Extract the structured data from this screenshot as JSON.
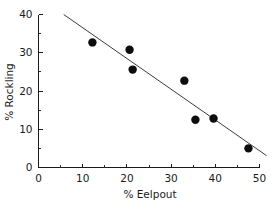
{
  "chart_data": {
    "type": "scatter",
    "title": "",
    "xlabel": "% Eelpout",
    "ylabel": "% Rockling",
    "xlim": [
      0,
      50
    ],
    "ylim": [
      0,
      40
    ],
    "xticks": [
      0,
      10,
      20,
      30,
      40,
      50
    ],
    "yticks": [
      0,
      10,
      20,
      30,
      40
    ],
    "xtick_labels": [
      "0",
      "10",
      "20",
      "30",
      "40",
      "50"
    ],
    "ytick_labels": [
      "0",
      "10",
      "20",
      "30",
      "40"
    ],
    "x_minor_ticks": [
      5,
      15,
      25,
      35,
      45
    ],
    "y_minor_ticks": [
      5,
      15,
      25,
      35
    ],
    "grid": false,
    "legend": false,
    "marker_style": "filled-circle",
    "marker_color": "#0d0d0d",
    "marker_size_px": 4.2,
    "line_color": "#3c3c3c",
    "background_color": "#ffffff",
    "axis_color": "#1a1a1a",
    "points": [
      {
        "x": 12.2,
        "y": 32.7
      },
      {
        "x": 20.6,
        "y": 30.8
      },
      {
        "x": 21.3,
        "y": 25.6
      },
      {
        "x": 33.0,
        "y": 22.7
      },
      {
        "x": 35.5,
        "y": 12.5
      },
      {
        "x": 39.6,
        "y": 12.8
      },
      {
        "x": 47.5,
        "y": 5.0
      }
    ],
    "x": [
      12.2,
      20.6,
      21.3,
      33.0,
      35.5,
      39.6,
      47.5
    ],
    "values": [
      32.7,
      30.8,
      25.6,
      22.7,
      12.5,
      12.8,
      5.0
    ],
    "trendline": {
      "type": "linear-fit",
      "slope": -0.804,
      "intercept": 44.6,
      "x_start": 5.7,
      "y_start": 40.0,
      "x_end": 51.6,
      "y_end": 3.1
    }
  },
  "axes": {
    "x_title": "% Eelpout",
    "y_title": "% Rockling"
  }
}
